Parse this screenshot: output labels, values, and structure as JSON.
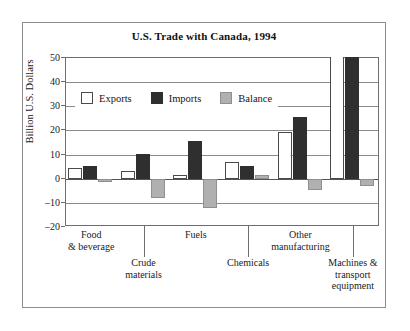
{
  "chart_data": {
    "type": "bar",
    "title": "U.S. Trade with Canada, 1994",
    "xlabel": "",
    "ylabel": "Billion U.S. Dollars",
    "ylim": [
      -20,
      50
    ],
    "ytick_step": 10,
    "yticks": [
      "50",
      "40",
      "30",
      "20",
      "10",
      "0",
      "–10",
      "–20"
    ],
    "grid": true,
    "legend_position": "upper-left-inside",
    "categories": [
      "Food\n& beverage",
      "Crude\nmaterials",
      "Fuels",
      "Chemicals",
      "Other\nmanufacturing",
      "Machines &\ntransport\nequipment"
    ],
    "category_lines": [
      [
        "Food",
        "& beverage"
      ],
      [
        "Crude",
        "materials"
      ],
      [
        "Fuels"
      ],
      [
        "Chemicals"
      ],
      [
        "Other",
        "manufacturing"
      ],
      [
        "Machines &",
        "transport",
        "equipment"
      ]
    ],
    "series": [
      {
        "name": "Exports",
        "color": "#ffffff",
        "values": [
          4.5,
          3.0,
          1.5,
          7.0,
          19.5,
          52.0
        ],
        "clipped": [
          false,
          false,
          false,
          false,
          false,
          true
        ]
      },
      {
        "name": "Imports",
        "color": "#2f2f2f",
        "values": [
          5.3,
          10.4,
          15.5,
          5.2,
          25.5,
          53.0
        ],
        "clipped": [
          false,
          false,
          false,
          false,
          false,
          true
        ]
      },
      {
        "name": "Balance",
        "color": "#b0b0b0",
        "values": [
          -1.3,
          -8.0,
          -12.0,
          1.5,
          -4.5,
          -3.0
        ],
        "clipped": [
          false,
          false,
          false,
          false,
          false,
          false
        ]
      }
    ]
  },
  "colors": {
    "exports": "#ffffff",
    "imports": "#2f2f2f",
    "balance": "#b0b0b0",
    "axis": "#6e6e6e",
    "grid": "#8a8a8a",
    "frame": "#8c8c8c"
  }
}
